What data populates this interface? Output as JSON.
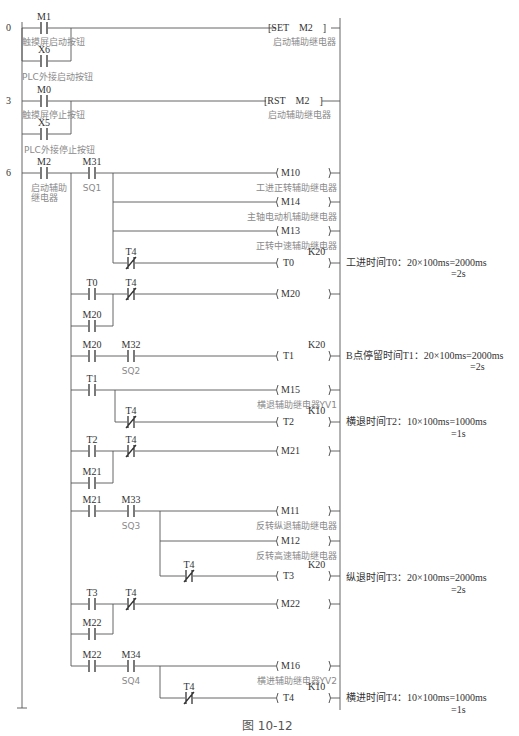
{
  "figure_caption": "图 10-12",
  "step_numbers": [
    "0",
    "3",
    "6"
  ],
  "contacts": {
    "M1": {
      "label": "M1",
      "comment": "触摸屏启动按钮"
    },
    "X6": {
      "label": "X6",
      "comment": "PLC外接启动按钮"
    },
    "M0": {
      "label": "M0",
      "comment": "触摸屏停止按钮"
    },
    "X5": {
      "label": "X5",
      "comment": "PLC外接停止按钮"
    },
    "M2": {
      "label": "M2",
      "comment": "启动辅助继电器"
    },
    "M31": {
      "label": "M31",
      "comment": "SQ1"
    },
    "T4a": {
      "label": "T4"
    },
    "T0": {
      "label": "T0"
    },
    "T4b": {
      "label": "T4"
    },
    "M20a": {
      "label": "M20"
    },
    "M20b": {
      "label": "M20"
    },
    "M32": {
      "label": "M32",
      "comment": "SQ2"
    },
    "T1": {
      "label": "T1"
    },
    "T4c": {
      "label": "T4"
    },
    "T2": {
      "label": "T2"
    },
    "T4d": {
      "label": "T4"
    },
    "M21a": {
      "label": "M21"
    },
    "M21b": {
      "label": "M21"
    },
    "M33": {
      "label": "M33",
      "comment": "SQ3"
    },
    "T4e": {
      "label": "T4"
    },
    "T3": {
      "label": "T3"
    },
    "T4f": {
      "label": "T4"
    },
    "M22a": {
      "label": "M22"
    },
    "M22b": {
      "label": "M22"
    },
    "M34": {
      "label": "M34",
      "comment": "SQ4"
    },
    "T4g": {
      "label": "T4"
    }
  },
  "instructions": {
    "set": {
      "text": "[SET    M2    ]",
      "comment": "启动辅助继电器"
    },
    "rst": {
      "text": "[RST    M2    ]",
      "comment": "启动辅助继电器"
    }
  },
  "coils": {
    "M10": {
      "label": "( M10     )",
      "comment": "工进正转辅助继电器"
    },
    "M14": {
      "label": "( M14     )",
      "comment": "主轴电动机辅助继电器"
    },
    "M13": {
      "label": "( M13     )",
      "comment": "正转中速辅助继电器"
    },
    "T0": {
      "label": "( T0       )",
      "preset": "K20"
    },
    "M20": {
      "label": "( M20     )"
    },
    "T1": {
      "label": "( T1       )",
      "preset": "K20"
    },
    "M15": {
      "label": "( M15     )",
      "comment": "横退辅助继电器YV1"
    },
    "T2": {
      "label": "( T2       )",
      "preset": "K10"
    },
    "M21": {
      "label": "( M21     )"
    },
    "M11": {
      "label": "( M11     )",
      "comment": "反转纵退辅助继电器"
    },
    "M12": {
      "label": "( M12     )",
      "comment": "反转高速辅助继电器"
    },
    "T3": {
      "label": "( T3       )",
      "preset": "K20"
    },
    "M22": {
      "label": "( M22     )"
    },
    "M16": {
      "label": "( M16     )",
      "comment": "横进辅助继电器YV2"
    },
    "T4": {
      "label": "( T4       )",
      "preset": "K10"
    }
  },
  "notes": {
    "T0": {
      "line1": "工进时间T0：20×100ms=2000ms",
      "line2": "=2s"
    },
    "T1": {
      "line1": "B点停留时间T1：20×100ms=2000ms",
      "line2": "=2s"
    },
    "T2": {
      "line1": "横退时间T2：10×100ms=1000ms",
      "line2": "=1s"
    },
    "T3": {
      "line1": "纵退时间T3：20×100ms=2000ms",
      "line2": "=2s"
    },
    "T4": {
      "line1": "横进时间T4：10×100ms=1000ms",
      "line2": "=1s"
    }
  },
  "colors": {
    "line": "#555555",
    "text": "#2a2a2a",
    "comment": "#8a8a8a"
  }
}
